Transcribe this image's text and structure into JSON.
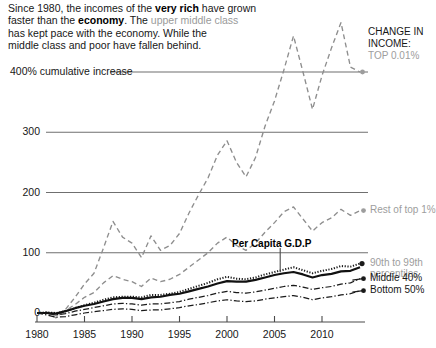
{
  "headline": {
    "line1_a": "Since 1980, the incomes of the ",
    "line1_bold": "very rich",
    "line1_b": " have grown",
    "line2_a": "faster than the ",
    "line2_bold": "economy",
    "line2_b": ". The ",
    "line2_gray": "upper middle class",
    "line3": "has kept pace with the economy. While the",
    "line4": "middle class and poor have fallen behind."
  },
  "corner": {
    "l1": "CHANGE IN",
    "l2": "INCOME:",
    "l3": "TOP 0.01%"
  },
  "annotation": {
    "gdp": "Per Capita G.D.P"
  },
  "series_labels": {
    "top001": "TOP 0.01%",
    "rest_top1": "Rest of top 1%",
    "p90_99_l1": "90th to 99th",
    "p90_99_l2": "percentiles",
    "middle40": "Middle 40%",
    "bottom50": "Bottom 50%"
  },
  "colors": {
    "ink": "#1a1a1a",
    "gray": "#9d9d9d",
    "grid": "#6f6f6f",
    "axis": "#4a4a4a",
    "dashed": "#8e8e8e"
  },
  "chart_data": {
    "type": "line",
    "title": "Since 1980, the incomes of the very rich have grown faster than the economy.",
    "xlabel": "",
    "ylabel": "400% cumulative increase",
    "ylabel_unit": "% cumulative increase",
    "xlim": [
      1980,
      2014
    ],
    "ylim": [
      -20,
      500
    ],
    "grid": true,
    "gridlines": [
      0,
      100,
      200,
      300,
      400
    ],
    "ytick_labels": [
      "0",
      "100",
      "200",
      "300",
      "400% cumulative increase"
    ],
    "yticks": [
      0,
      100,
      200,
      300,
      400
    ],
    "xticks": [
      1980,
      1985,
      1990,
      1995,
      2000,
      2005,
      2010
    ],
    "xtick_labels": [
      "1980",
      "1985",
      "1990",
      "1995",
      "2000",
      "2005",
      "2010"
    ],
    "legend_position": "right-of-line-ends",
    "x": [
      1980,
      1981,
      1982,
      1983,
      1984,
      1985,
      1986,
      1987,
      1988,
      1989,
      1990,
      1991,
      1992,
      1993,
      1994,
      1995,
      1996,
      1997,
      1998,
      1999,
      2000,
      2001,
      2002,
      2003,
      2004,
      2005,
      2006,
      2007,
      2008,
      2009,
      2010,
      2011,
      2012,
      2013,
      2014
    ],
    "series": [
      {
        "name": "TOP 0.01%",
        "style": "dashed",
        "color": "#8e8e8e",
        "values": [
          0,
          2,
          -8,
          6,
          26,
          48,
          66,
          108,
          152,
          126,
          116,
          92,
          128,
          104,
          112,
          132,
          166,
          196,
          224,
          262,
          286,
          250,
          226,
          258,
          310,
          352,
          404,
          460,
          400,
          338,
          394,
          440,
          482,
          408,
          400
        ]
      },
      {
        "name": "Rest of top 1%",
        "style": "dashed",
        "color": "#8e8e8e",
        "values": [
          0,
          1,
          -4,
          4,
          14,
          26,
          34,
          50,
          62,
          56,
          52,
          44,
          58,
          52,
          56,
          64,
          76,
          88,
          100,
          116,
          126,
          112,
          104,
          116,
          134,
          150,
          168,
          176,
          156,
          136,
          150,
          158,
          172,
          162,
          170
        ]
      },
      {
        "name": "90th to 99th percentiles",
        "style": "dotted",
        "color": "#1a1a1a",
        "values": [
          0,
          1,
          0,
          3,
          8,
          13,
          17,
          22,
          26,
          27,
          27,
          26,
          30,
          30,
          32,
          35,
          40,
          45,
          50,
          56,
          60,
          57,
          56,
          59,
          64,
          68,
          72,
          76,
          71,
          66,
          70,
          73,
          78,
          77,
          82
        ]
      },
      {
        "name": "Per Capita G.D.P",
        "style": "solid",
        "color": "#111111",
        "values": [
          0,
          0,
          -1,
          3,
          8,
          12,
          15,
          19,
          23,
          25,
          25,
          23,
          26,
          27,
          30,
          32,
          36,
          40,
          44,
          49,
          53,
          52,
          52,
          55,
          59,
          63,
          66,
          68,
          64,
          59,
          63,
          65,
          69,
          70,
          76
        ]
      },
      {
        "name": "Middle 40%",
        "style": "dashdot",
        "color": "#1a1a1a",
        "values": [
          0,
          -1,
          -3,
          -1,
          3,
          6,
          9,
          12,
          15,
          16,
          15,
          13,
          15,
          15,
          17,
          19,
          23,
          26,
          29,
          33,
          36,
          34,
          33,
          35,
          38,
          41,
          44,
          46,
          43,
          39,
          42,
          44,
          48,
          50,
          57
        ]
      },
      {
        "name": "Bottom 50%",
        "style": "dashdot",
        "color": "#1a1a1a",
        "values": [
          0,
          -3,
          -7,
          -6,
          -3,
          0,
          2,
          4,
          6,
          7,
          6,
          4,
          5,
          5,
          7,
          9,
          12,
          14,
          17,
          20,
          22,
          20,
          19,
          20,
          23,
          25,
          27,
          29,
          26,
          22,
          25,
          27,
          30,
          32,
          37
        ]
      }
    ]
  }
}
